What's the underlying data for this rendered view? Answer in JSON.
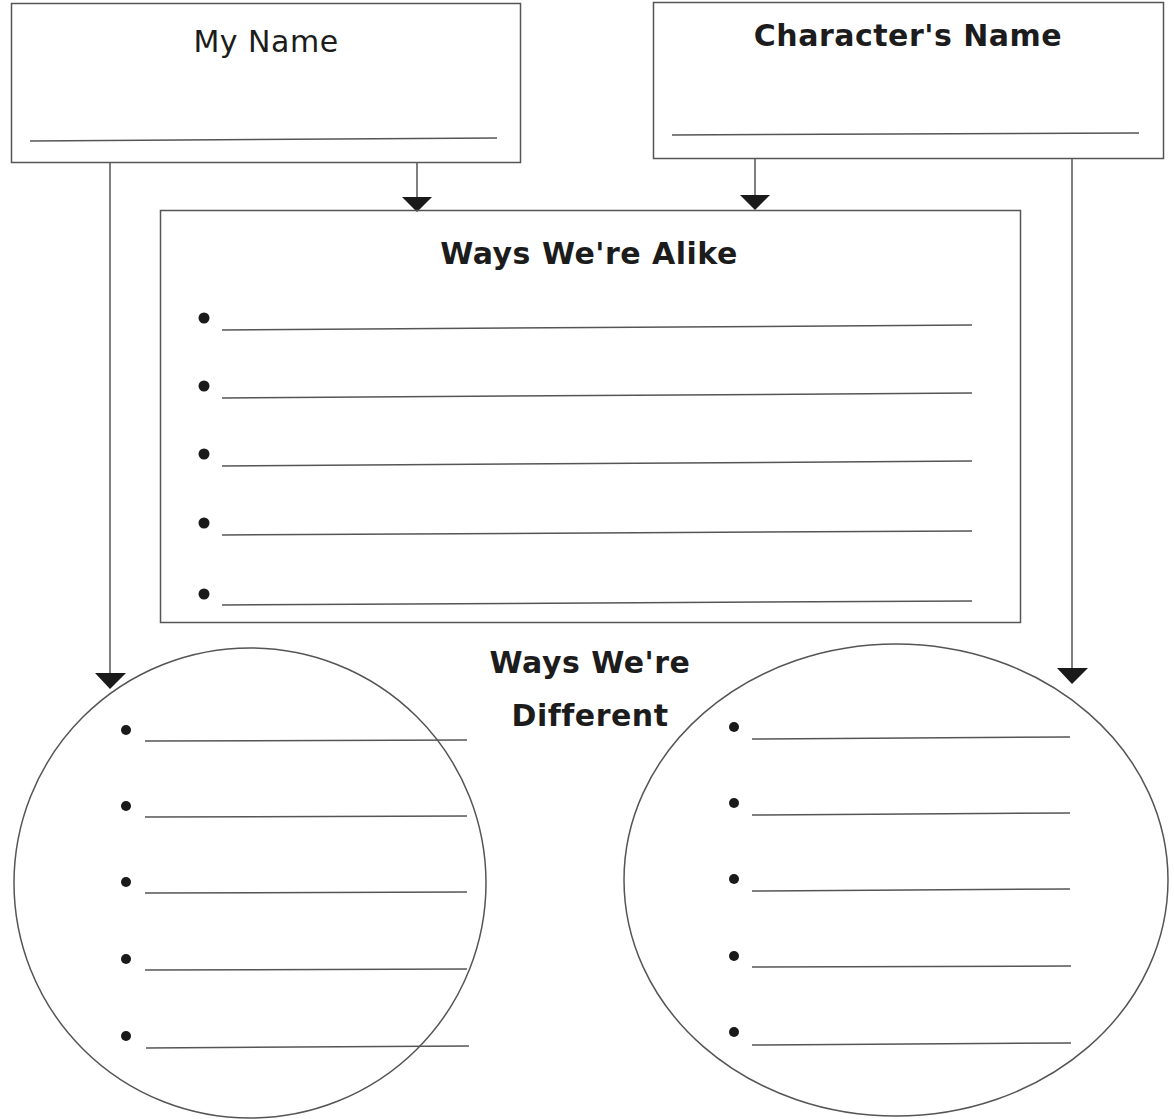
{
  "worksheet": {
    "my_name_box": {
      "label": "My Name",
      "value": ""
    },
    "character_name_box": {
      "label": "Character's Name",
      "value": ""
    },
    "alike_box": {
      "title": "Ways We're Alike",
      "lines": [
        "",
        "",
        "",
        "",
        ""
      ]
    },
    "different_section": {
      "title_line1": "Ways We're",
      "title_line2": "Different",
      "my_ellipse_lines": [
        "",
        "",
        "",
        "",
        ""
      ],
      "character_ellipse_lines": [
        "",
        "",
        "",
        "",
        ""
      ]
    }
  },
  "colors": {
    "line": "#555555",
    "ink": "#1c1c1c",
    "background": "#ffffff"
  }
}
